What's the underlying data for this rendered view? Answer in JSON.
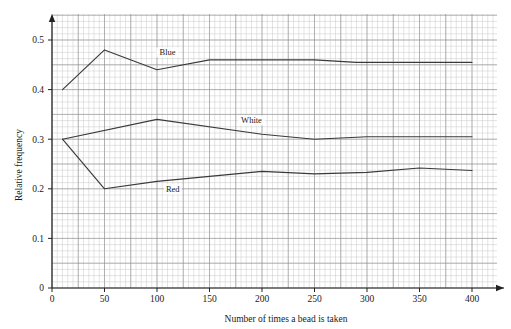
{
  "chart_data": {
    "type": "line",
    "title": "",
    "xlabel": "Number of times a bead is taken",
    "ylabel": "Relative frequency",
    "xlim": [
      0,
      400
    ],
    "ylim": [
      0,
      0.55
    ],
    "xticks": [
      0,
      50,
      100,
      150,
      200,
      250,
      300,
      350,
      400
    ],
    "xtick_labels": [
      "0",
      "50",
      "100",
      "150",
      "200",
      "250",
      "300",
      "350",
      "400"
    ],
    "yticks": [
      0,
      0.1,
      0.2,
      0.3,
      0.4,
      0.5
    ],
    "ytick_labels": [
      "0",
      "0.1",
      "0.2",
      "0.3",
      "0.4",
      "0.5"
    ],
    "grid": true,
    "grid_minor_step_x": 5,
    "grid_minor_step_y": 0.0125,
    "legend_position": "inline-annotations",
    "line_color": "#3a3a3a",
    "grid_minor_color": "#c9c9c9",
    "grid_major_color": "#8e8e8e",
    "axis_color": "#222222",
    "series": [
      {
        "name": "Blue",
        "label": "Blue",
        "label_x": 110,
        "label_y": 0.472,
        "x": [
          10,
          50,
          100,
          150,
          200,
          250,
          290,
          400
        ],
        "values": [
          0.4,
          0.48,
          0.44,
          0.46,
          0.46,
          0.46,
          0.455,
          0.455
        ]
      },
      {
        "name": "White",
        "label": "White",
        "label_x": 190,
        "label_y": 0.335,
        "x": [
          10,
          100,
          200,
          250,
          300,
          350,
          400
        ],
        "values": [
          0.3,
          0.34,
          0.31,
          0.3,
          0.305,
          0.305,
          0.305
        ]
      },
      {
        "name": "Red",
        "label": "Red",
        "label_x": 115,
        "label_y": 0.196,
        "x": [
          10,
          50,
          100,
          150,
          200,
          250,
          300,
          350,
          400
        ],
        "values": [
          0.3,
          0.2,
          0.215,
          0.225,
          0.235,
          0.23,
          0.233,
          0.242,
          0.237
        ]
      }
    ]
  }
}
